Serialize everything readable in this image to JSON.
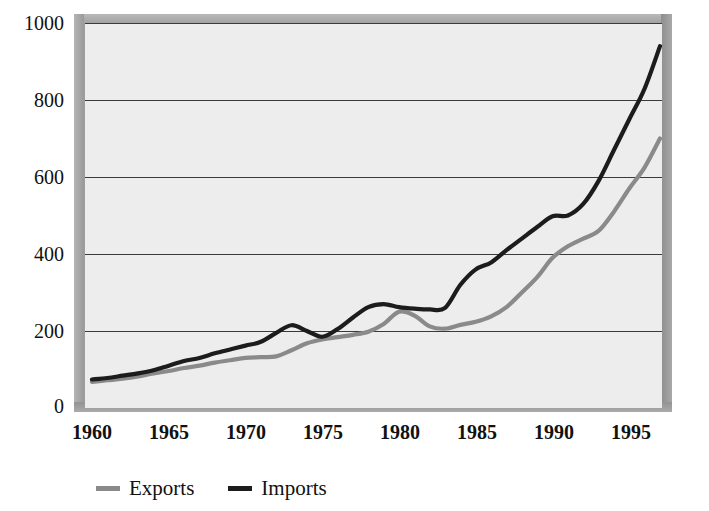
{
  "chart_data": {
    "type": "line",
    "title": "",
    "subtitle": "",
    "xlabel": "",
    "ylabel": "",
    "xlim": [
      1960,
      1997
    ],
    "ylim": [
      0,
      1000
    ],
    "grid": true,
    "grid_axis": "y",
    "legend_position": "bottom-left",
    "x_ticks": [
      "1960",
      "1965",
      "1970",
      "1975",
      "1980",
      "1985",
      "1990",
      "1995"
    ],
    "x_tick_values": [
      1960,
      1965,
      1970,
      1975,
      1980,
      1985,
      1990,
      1995
    ],
    "y_ticks": [
      "0",
      "200",
      "400",
      "600",
      "800",
      "1000"
    ],
    "y_tick_values": [
      0,
      200,
      400,
      600,
      800,
      1000
    ],
    "x": [
      1960,
      1961,
      1962,
      1963,
      1964,
      1965,
      1966,
      1967,
      1968,
      1969,
      1970,
      1971,
      1972,
      1973,
      1974,
      1975,
      1976,
      1977,
      1978,
      1979,
      1980,
      1981,
      1982,
      1983,
      1984,
      1985,
      1986,
      1987,
      1988,
      1989,
      1990,
      1991,
      1992,
      1993,
      1994,
      1995,
      1996,
      1997
    ],
    "series": [
      {
        "name": "Exports",
        "color": "#8a8a8a",
        "values": [
          68,
          72,
          76,
          82,
          90,
          96,
          104,
          110,
          118,
          124,
          130,
          132,
          134,
          150,
          168,
          178,
          184,
          190,
          198,
          218,
          250,
          240,
          212,
          206,
          216,
          224,
          238,
          262,
          300,
          340,
          390,
          420,
          440,
          460,
          510,
          570,
          625,
          700
        ]
      },
      {
        "name": "Imports",
        "color": "#1c1c1c",
        "values": [
          74,
          78,
          84,
          90,
          98,
          110,
          122,
          130,
          142,
          152,
          162,
          172,
          195,
          215,
          200,
          185,
          205,
          235,
          262,
          270,
          262,
          258,
          256,
          260,
          320,
          360,
          378,
          410,
          440,
          470,
          498,
          500,
          530,
          590,
          670,
          750,
          830,
          940
        ]
      }
    ],
    "annotations": []
  },
  "legend": {
    "items": [
      {
        "label": "Exports",
        "swatch_name": "legend-swatch-exports",
        "color": "#8a8a8a"
      },
      {
        "label": "Imports",
        "swatch_name": "legend-swatch-imports",
        "color": "#1c1c1c"
      }
    ]
  },
  "colors": {
    "plot_background": "#ededed",
    "page_background": "#ffffff",
    "gridline": "#3a3a3a",
    "frame": "#9d9d9d",
    "text": "#111111"
  }
}
